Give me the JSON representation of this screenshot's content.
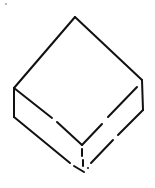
{
  "figure": {
    "stroke_color": "#111111",
    "background_color": "#ffffff",
    "stroke_width": 2,
    "vertices": {
      "top": [
        75,
        17
      ],
      "left_top": [
        14,
        88
      ],
      "left_bottom": [
        14,
        117
      ],
      "right_top": [
        142,
        80
      ],
      "right_bottom": [
        143,
        110
      ],
      "front_top": [
        82,
        145
      ],
      "front_bottom": [
        84,
        172
      ]
    },
    "speck": [
      6,
      4
    ]
  }
}
